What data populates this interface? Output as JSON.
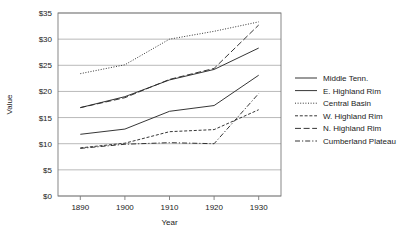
{
  "chart_data": {
    "type": "line",
    "title": "",
    "xlabel": "Year",
    "ylabel": "Value",
    "x": [
      1890,
      1900,
      1910,
      1920,
      1930
    ],
    "xlim": [
      1885,
      1935
    ],
    "ylim": [
      0,
      35
    ],
    "ytick_labels": [
      "$0",
      "$5",
      "$10",
      "$15",
      "$20",
      "$25",
      "$30",
      "$35"
    ],
    "ytick_values": [
      0,
      5,
      10,
      15,
      20,
      25,
      30,
      35
    ],
    "xtick_labels": [
      "1890",
      "1900",
      "1910",
      "1920",
      "1930"
    ],
    "grid": "horizontal",
    "legend_position": "right",
    "series": [
      {
        "name": "Middle Tenn.",
        "style": "solid",
        "values": [
          16.9,
          19.0,
          22.2,
          24.2,
          28.3
        ]
      },
      {
        "name": "E. Highland Rim",
        "style": "solid",
        "values": [
          11.8,
          12.8,
          16.2,
          17.3,
          23.1
        ]
      },
      {
        "name": "Central Basin",
        "style": "dotted",
        "values": [
          23.4,
          25.1,
          30.0,
          31.5,
          33.3
        ]
      },
      {
        "name": "W. Highland Rim",
        "style": "dashed",
        "values": [
          9.2,
          10.1,
          12.3,
          12.7,
          16.5
        ]
      },
      {
        "name": "N. Highland Rim",
        "style": "dash-long",
        "values": [
          16.9,
          18.8,
          22.3,
          24.4,
          32.7
        ]
      },
      {
        "name": "Cumberland Plateau",
        "style": "dash-dot",
        "values": [
          9.1,
          9.9,
          10.2,
          10.0,
          19.6
        ]
      }
    ]
  },
  "legend": {
    "items": [
      {
        "label": "Middle Tenn."
      },
      {
        "label": "E. Highland Rim"
      },
      {
        "label": "Central Basin"
      },
      {
        "label": "W. Highland Rim"
      },
      {
        "label": "N. Highland Rim"
      },
      {
        "label": "Cumberland Plateau"
      }
    ]
  },
  "colors": {
    "line": "#2b2b2b",
    "grid": "#9a9a9a",
    "frame": "#7a7a7a",
    "text": "#1a1a1a",
    "background": "#ffffff"
  }
}
